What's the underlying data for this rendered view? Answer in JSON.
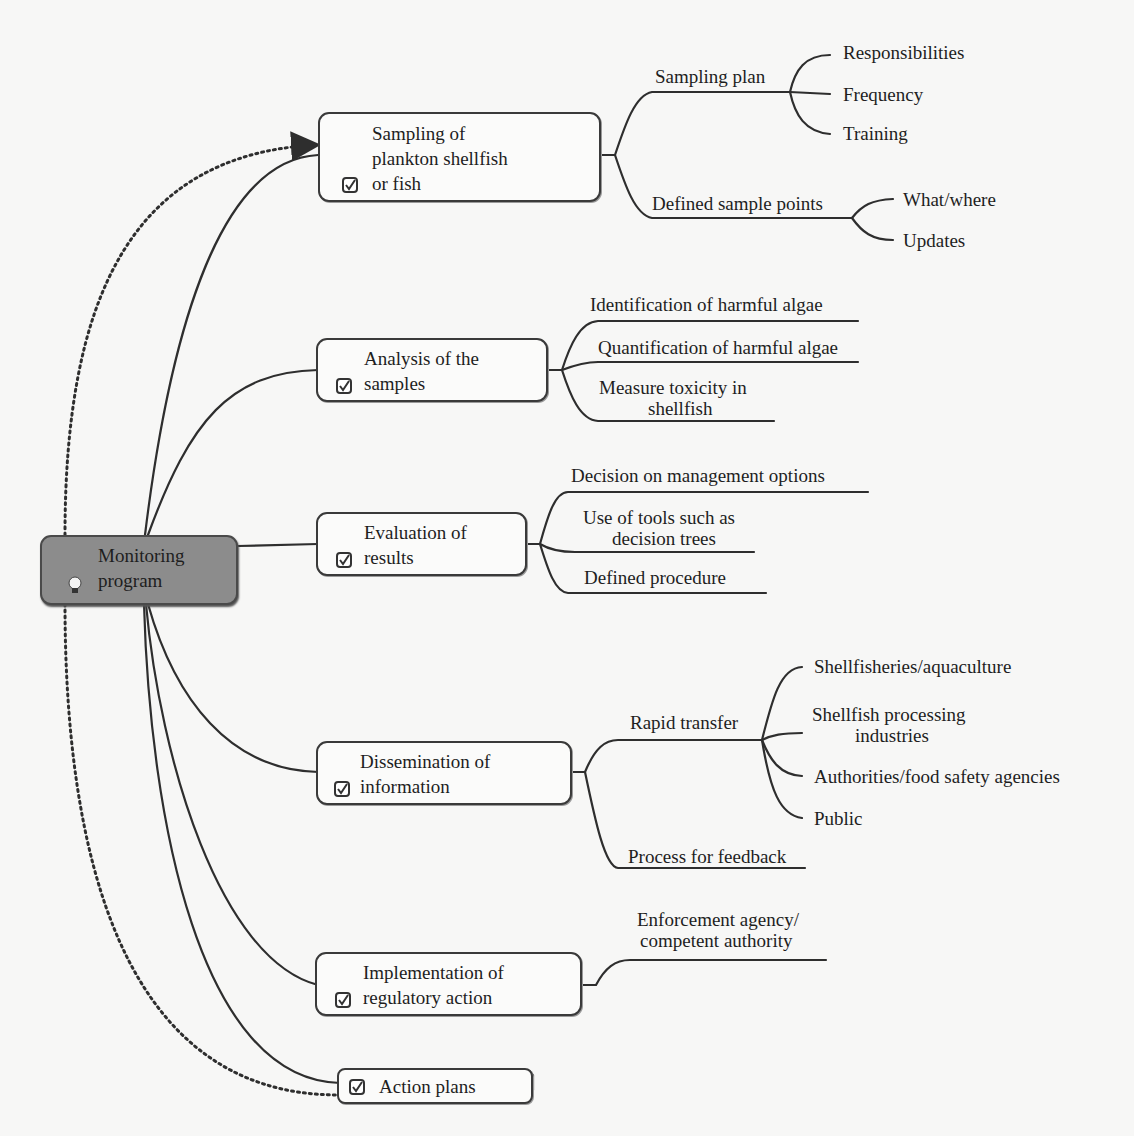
{
  "root": {
    "label_line1": "Monitoring",
    "label_line2": "program",
    "icon": "lightbulb-icon",
    "fill": "#8c8c8c"
  },
  "branches": [
    {
      "id": "sampling",
      "line1": "Sampling of",
      "line2": "plankton shellfish",
      "line3": "or fish",
      "icon": "checkbox-icon",
      "children": [
        {
          "label": "Sampling plan",
          "children": [
            "Responsibilities",
            "Frequency",
            "Training"
          ]
        },
        {
          "label": "Defined sample points",
          "children": [
            "What/where",
            "Updates"
          ]
        }
      ]
    },
    {
      "id": "analysis",
      "line1": "Analysis of the",
      "line2": "samples",
      "icon": "checkbox-icon",
      "children": [
        {
          "label": "Identification of harmful algae"
        },
        {
          "label": "Quantification of harmful algae"
        },
        {
          "label_line1": "Measure toxicity in",
          "label_line2": "shellfish"
        }
      ]
    },
    {
      "id": "evaluation",
      "line1": "Evaluation of",
      "line2": "results",
      "icon": "checkbox-icon",
      "children": [
        {
          "label": "Decision on management options"
        },
        {
          "label_line1": "Use of tools such as",
          "label_line2": "decision trees"
        },
        {
          "label": "Defined procedure"
        }
      ]
    },
    {
      "id": "dissemination",
      "line1": "Dissemination of",
      "line2": "information",
      "icon": "checkbox-icon",
      "children": [
        {
          "label": "Rapid transfer",
          "children": [
            {
              "label": "Shellfisheries/aquaculture"
            },
            {
              "label_line1": "Shellfish processing",
              "label_line2": "industries"
            },
            {
              "label": "Authorities/food safety agencies"
            },
            {
              "label": "Public"
            }
          ]
        },
        {
          "label": "Process for feedback"
        }
      ]
    },
    {
      "id": "implementation",
      "line1": "Implementation of",
      "line2": "regulatory action",
      "icon": "checkbox-icon",
      "children": [
        {
          "label_line1": "Enforcement agency/",
          "label_line2": "competent authority"
        }
      ]
    },
    {
      "id": "action-plans",
      "line1": "Action plans",
      "icon": "checkbox-icon",
      "children": []
    }
  ],
  "relationships": [
    {
      "from": "root",
      "to": "sampling",
      "style": "dotted-arrow"
    },
    {
      "from": "action-plans",
      "to": "root",
      "style": "dotted"
    }
  ],
  "colors": {
    "line": "#2e2e2e",
    "root_fill": "#8c8c8c",
    "node_fill": "#fbfbfa",
    "background": "#f7f7f6"
  }
}
